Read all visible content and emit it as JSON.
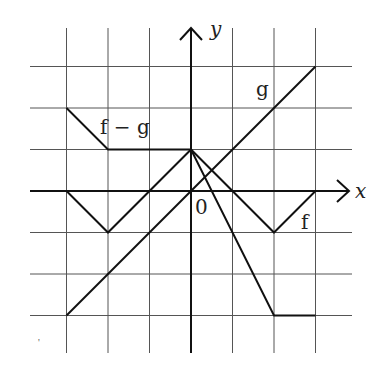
{
  "chart_data": {
    "type": "line",
    "title": "",
    "xlabel": "x",
    "ylabel": "y",
    "origin_label": "0",
    "xlim": [
      -3,
      3
    ],
    "ylim": [
      -3,
      3
    ],
    "grid": true,
    "grid_step": 1,
    "series": [
      {
        "name": "f",
        "label": "f",
        "points": [
          [
            -3,
            0
          ],
          [
            -2,
            -1
          ],
          [
            0,
            1
          ],
          [
            2,
            -1
          ],
          [
            3,
            0
          ]
        ]
      },
      {
        "name": "g",
        "label": "g",
        "points": [
          [
            -3,
            -3
          ],
          [
            3,
            3
          ]
        ]
      },
      {
        "name": "f - g",
        "label": "f − g",
        "points": [
          [
            -3,
            2
          ],
          [
            -2,
            1
          ],
          [
            0,
            1
          ],
          [
            2,
            -3
          ],
          [
            3,
            -3
          ]
        ]
      }
    ]
  },
  "labels": {
    "x_axis": "x",
    "y_axis": "y",
    "origin": "0",
    "f": "f",
    "g": "g",
    "f_minus_g": "f − g"
  }
}
